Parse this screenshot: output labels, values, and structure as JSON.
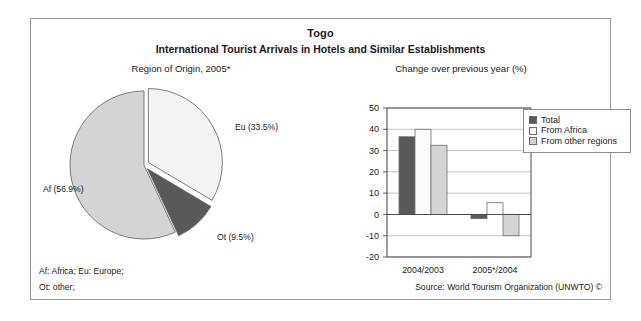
{
  "figure": {
    "title": "Togo",
    "subtitle": "International Tourist Arrivals in Hotels and Similar Establishments",
    "pie_caption": "Region of Origin, 2005*",
    "bar_caption": "Change over previous year (%)",
    "footnote_1": "Af: Africa; Eu: Europe;",
    "footnote_2": "Ot: other;",
    "source": "Source: World Tourism Organization (UNWTO) ©"
  },
  "colors": {
    "dark_gray": "#595959",
    "light_gray": "#d4d4d4",
    "near_white": "#f4f4f4",
    "outline": "#6e6e6e",
    "axis": "#4d4d4d",
    "grid": "#b5b5b5",
    "frame": "#9a9a9a"
  },
  "legend": {
    "items": [
      {
        "label": "Total",
        "color": "#595959"
      },
      {
        "label": "From Africa",
        "color": "#fbfbfb"
      },
      {
        "label": "From other regions",
        "color": "#d4d4d4"
      }
    ]
  },
  "chart_data": [
    {
      "type": "pie",
      "title": "Region of Origin, 2005*",
      "categories": [
        "Af",
        "Eu",
        "Ot"
      ],
      "values": [
        56.9,
        33.5,
        9.5
      ],
      "labels": [
        "Af (56.9%)",
        "Eu (33.5%)",
        "Ot (9.5%)"
      ],
      "slice_colors": [
        "#d4d4d4",
        "#f4f4f4",
        "#595959"
      ],
      "exploded": [
        "Eu",
        "Ot"
      ],
      "units": "percent",
      "legend": "none"
    },
    {
      "type": "bar",
      "title": "Change over previous year (%)",
      "categories": [
        "2004/2003",
        "2005*/2004"
      ],
      "series": [
        {
          "name": "Total",
          "values": [
            36.5,
            -2.0
          ],
          "color": "#595959"
        },
        {
          "name": "From Africa",
          "values": [
            40.0,
            5.5
          ],
          "color": "#fbfbfb"
        },
        {
          "name": "From other regions",
          "values": [
            32.5,
            -10.0
          ],
          "color": "#d4d4d4"
        }
      ],
      "xlabel": "",
      "ylabel": "",
      "ylim": [
        -20,
        50
      ],
      "yticks": [
        50,
        40,
        30,
        20,
        10,
        0,
        -10,
        -20
      ],
      "ytick_labels": [
        "50",
        "40",
        "30",
        "20",
        "10",
        "0",
        "-10",
        "-20"
      ],
      "grid": "horizontal",
      "legend_position": "top-right-outside"
    }
  ]
}
